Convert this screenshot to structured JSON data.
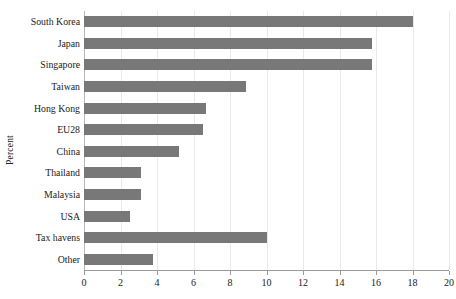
{
  "chart_data": {
    "type": "bar",
    "orientation": "horizontal",
    "title": "",
    "xlabel": "",
    "ylabel": "Percent",
    "categories": [
      "South Korea",
      "Japan",
      "Singapore",
      "Taiwan",
      "Hong Kong",
      "EU28",
      "China",
      "Thailand",
      "Malaysia",
      "USA",
      "Tax havens",
      "Other"
    ],
    "values": [
      18.0,
      15.8,
      15.8,
      8.9,
      6.7,
      6.5,
      5.2,
      3.1,
      3.1,
      2.5,
      10.0,
      3.8
    ],
    "xlim": [
      0,
      20
    ],
    "xticks": [
      0,
      2,
      4,
      6,
      8,
      10,
      12,
      14,
      16,
      18,
      20
    ],
    "xtick_labels": [
      "0",
      "2",
      "4",
      "6",
      "8",
      "10",
      "12",
      "14",
      "16",
      "18",
      "20"
    ],
    "grid": "vertical",
    "legend": null,
    "bar_color": "#787878",
    "gridline_color": "#e9e9e9",
    "axis_color": "#9a9a9a"
  }
}
